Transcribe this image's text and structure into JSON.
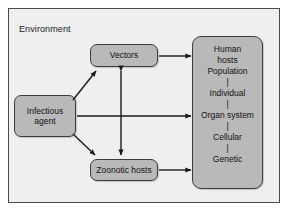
{
  "diagram": {
    "title_label": "Environment",
    "nodes": {
      "vectors": {
        "label": "Vectors"
      },
      "infectious_agent": {
        "line1": "Infectious",
        "line2": "agent"
      },
      "zoonotic_hosts": {
        "label": "Zoonotic hosts"
      },
      "human_hosts": {
        "line1": "Human",
        "line2": "hosts",
        "levels": [
          "Population",
          "Individual",
          "Organ system",
          "Cellular",
          "Genetic"
        ],
        "separator": "|"
      }
    },
    "edges": [
      {
        "name": "agent-to-vectors",
        "from": "Infectious agent",
        "to": "Vectors",
        "style": "single-arrow"
      },
      {
        "name": "agent-to-zoonotic",
        "from": "Infectious agent",
        "to": "Zoonotic hosts",
        "style": "single-arrow"
      },
      {
        "name": "agent-to-human-hosts",
        "from": "Infectious agent",
        "to": "Human hosts",
        "style": "single-arrow"
      },
      {
        "name": "vectors-to-human-hosts",
        "from": "Vectors",
        "to": "Human hosts",
        "style": "single-arrow"
      },
      {
        "name": "zoonotic-to-human-hosts",
        "from": "Zoonotic hosts",
        "to": "Human hosts",
        "style": "single-arrow"
      },
      {
        "name": "vectors-zoonotic-bidirectional",
        "from": "Vectors",
        "to": "Zoonotic hosts",
        "style": "double-arrow"
      }
    ],
    "colors": {
      "environment_background": "#efefef",
      "environment_border": "#4a4a4a",
      "node_fill": "#b9b9b9",
      "node_border": "#3d3d3d",
      "arrow": "#1a1a1a",
      "text": "#111111",
      "page_background": "#ffffff"
    }
  }
}
